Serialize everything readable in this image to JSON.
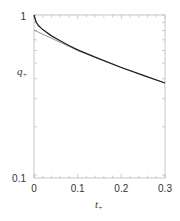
{
  "chart_data": {
    "type": "line",
    "title": "",
    "xlabel": "t+",
    "ylabel": "q+",
    "xlim": [
      0,
      0.3
    ],
    "ylim": [
      0.1,
      1
    ],
    "yscale": "log",
    "x_ticks": [
      "0",
      "0.1",
      "0.2",
      "0.3"
    ],
    "y_ticks": [
      "0.1",
      "1"
    ],
    "grid": false,
    "legend": null,
    "series": [
      {
        "name": "exact",
        "color": "#222222",
        "x": [
          0,
          0.005,
          0.01,
          0.02,
          0.04,
          0.06,
          0.08,
          0.1,
          0.14,
          0.2,
          0.25,
          0.3
        ],
        "y": [
          1.0,
          0.9,
          0.86,
          0.81,
          0.74,
          0.69,
          0.645,
          0.605,
          0.545,
          0.47,
          0.42,
          0.376
        ]
      },
      {
        "name": "asymptote",
        "color": "#888888",
        "x": [
          0,
          0.1,
          0.2,
          0.3
        ],
        "y": [
          0.805,
          0.6,
          0.47,
          0.376
        ]
      }
    ]
  },
  "labels": {
    "xlabel_main": "t",
    "xlabel_sub": "+",
    "ylabel_main": "q",
    "ylabel_sub": "+",
    "y_top": "1",
    "y_bottom": "0.1",
    "x0": "0",
    "x1": "0.1",
    "x2": "0.2",
    "x3": "0.3"
  }
}
